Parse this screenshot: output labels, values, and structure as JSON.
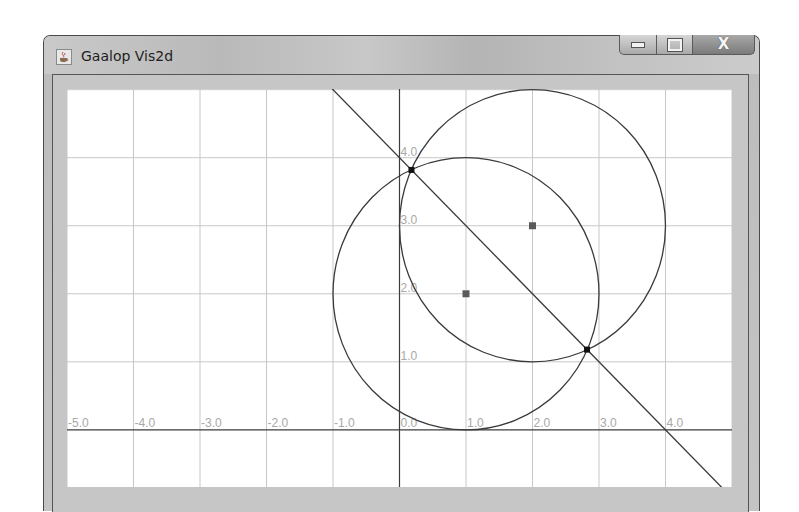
{
  "window": {
    "title": "Gaalop Vis2d",
    "icon": "java-coffee-icon",
    "buttons": {
      "minimize": "minimize-icon",
      "maximize": "maximize-icon",
      "close_label": "X"
    }
  },
  "colors": {
    "grid": "#c8c8c8",
    "axis": "#3c3c3c",
    "curve": "#3a3a3a",
    "tick_label": "#a8a8a8",
    "center_point": "#5a5a5a",
    "intersection_point": "#111111"
  },
  "plot": {
    "viewport": {
      "xmin": -5.0,
      "xmax": 5.0,
      "ymin": -0.84,
      "ymax": 5.01
    },
    "x_tick_labels": [
      "-5.0",
      "-4.0",
      "-3.0",
      "-2.0",
      "-1.0",
      "0.0",
      "1.0",
      "2.0",
      "3.0",
      "4.0"
    ],
    "y_tick_labels": [
      "1.0",
      "2.0",
      "3.0",
      "4.0"
    ],
    "circles": [
      {
        "name": "circle-a",
        "cx": 1,
        "cy": 2,
        "r": 2
      },
      {
        "name": "circle-b",
        "cx": 2,
        "cy": 3,
        "r": 2
      }
    ],
    "line": {
      "name": "radical-line",
      "equation": "x + y = 4"
    },
    "center_points": [
      {
        "x": 1,
        "y": 2
      },
      {
        "x": 2,
        "y": 3
      }
    ],
    "intersection_points": [
      {
        "x": 0.18,
        "y": 3.82
      },
      {
        "x": 2.82,
        "y": 1.18
      }
    ]
  }
}
